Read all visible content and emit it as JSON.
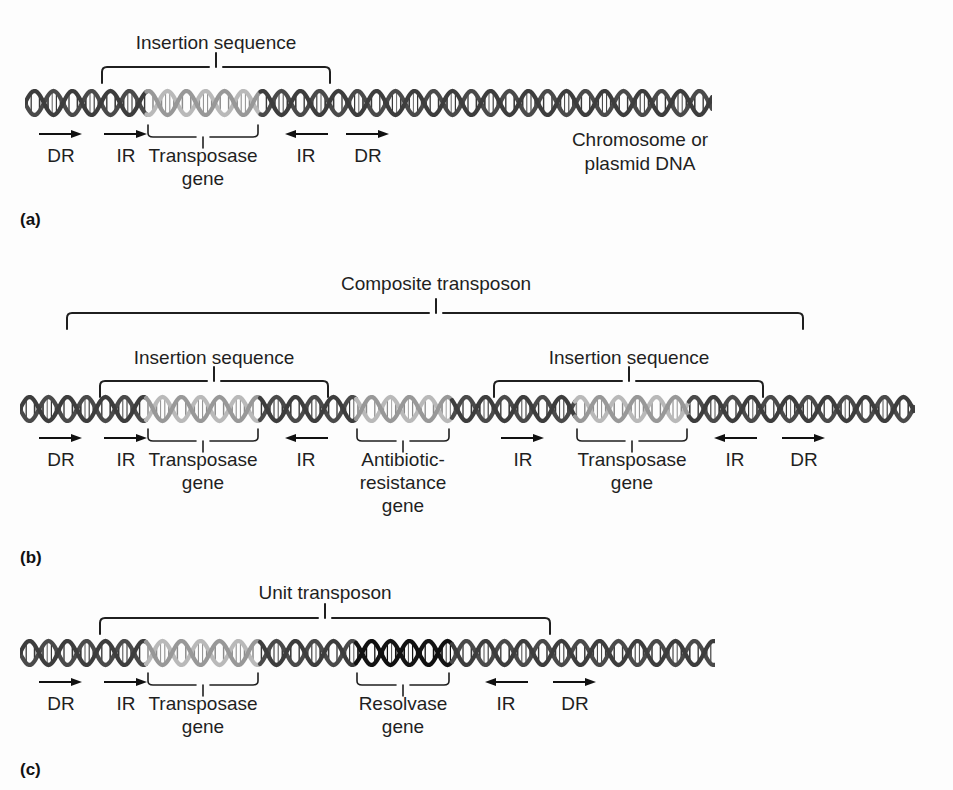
{
  "figure": {
    "colors": {
      "dna_default": "#4a4a4a",
      "dna_light": "#b9b9b9",
      "dna_mid": "#8d8d8d",
      "dna_dark": "#141414",
      "line": "#1f1f1f",
      "background": "#fdfdfd"
    }
  },
  "panels": [
    {
      "tag": "(a)",
      "name": "insertion-sequence-panel",
      "top_brackets": [
        {
          "label": "Insertion sequence"
        }
      ],
      "gene_brackets": [
        {
          "label": "Transposase\ngene",
          "line1": "Transposase",
          "line2": "gene"
        }
      ],
      "markers": [
        {
          "label": "DR",
          "direction": "right"
        },
        {
          "label": "IR",
          "direction": "right"
        },
        {
          "label": "IR",
          "direction": "left"
        },
        {
          "label": "DR",
          "direction": "right"
        }
      ],
      "annotations": [
        {
          "line1": "Chromosome or",
          "line2": "plasmid DNA"
        }
      ]
    },
    {
      "tag": "(b)",
      "name": "composite-transposon-panel",
      "top_brackets": [
        {
          "label": "Composite transposon"
        },
        {
          "label": "Insertion sequence"
        },
        {
          "label": "Insertion sequence"
        }
      ],
      "gene_brackets": [
        {
          "line1": "Transposase",
          "line2": "gene"
        },
        {
          "line1": "Antibiotic-",
          "line2": "resistance",
          "line3": "gene"
        },
        {
          "line1": "Transposase",
          "line2": "gene"
        }
      ],
      "markers": [
        {
          "label": "DR",
          "direction": "right"
        },
        {
          "label": "IR",
          "direction": "right"
        },
        {
          "label": "IR",
          "direction": "left"
        },
        {
          "label": "IR",
          "direction": "right"
        },
        {
          "label": "IR",
          "direction": "left"
        },
        {
          "label": "DR",
          "direction": "right"
        }
      ]
    },
    {
      "tag": "(c)",
      "name": "unit-transposon-panel",
      "top_brackets": [
        {
          "label": "Unit transposon"
        }
      ],
      "gene_brackets": [
        {
          "line1": "Transposase",
          "line2": "gene"
        },
        {
          "line1": "Resolvase",
          "line2": "gene"
        }
      ],
      "markers": [
        {
          "label": "DR",
          "direction": "right"
        },
        {
          "label": "IR",
          "direction": "right"
        },
        {
          "label": "IR",
          "direction": "left"
        },
        {
          "label": "DR",
          "direction": "right"
        }
      ]
    }
  ],
  "text": {
    "insertion_sequence": "Insertion sequence",
    "composite_transposon": "Composite transposon",
    "unit_transposon": "Unit transposon",
    "transposase": "Transposase",
    "resolvase": "Resolvase",
    "gene": "gene",
    "antibiotic": "Antibiotic-",
    "resistance": "resistance",
    "chromosome_or": "Chromosome or",
    "plasmid_dna": "plasmid DNA",
    "dr": "DR",
    "ir": "IR",
    "tag_a": "(a)",
    "tag_b": "(b)",
    "tag_c": "(c)"
  }
}
